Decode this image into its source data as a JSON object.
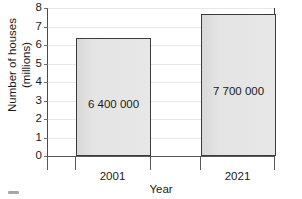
{
  "chart_data": {
    "type": "bar",
    "title": "",
    "categories": [
      "2001",
      "2021"
    ],
    "values": [
      6.4,
      7.7
    ],
    "data_labels": [
      "6 400 000",
      "7 700 000"
    ],
    "xlabel": "Year",
    "ylabel": "Number of houses (millions)",
    "ylabel_lines": [
      "Number of houses",
      "(millions)"
    ],
    "ylim": [
      0,
      8
    ],
    "ytick_labels": [
      "0",
      "1",
      "2",
      "3",
      "4",
      "5",
      "6",
      "7",
      "8"
    ],
    "ytick_values": [
      0,
      1,
      2,
      3,
      4,
      5,
      6,
      7,
      8
    ],
    "grid": true,
    "legend": "none",
    "bar_fill_color": "#e4e4e4",
    "bar_edge_color": "#3c3c3c",
    "gridline_color": "#e8e8e8",
    "axis_color": "#4a4a4a",
    "background_color": "#ffffff"
  }
}
